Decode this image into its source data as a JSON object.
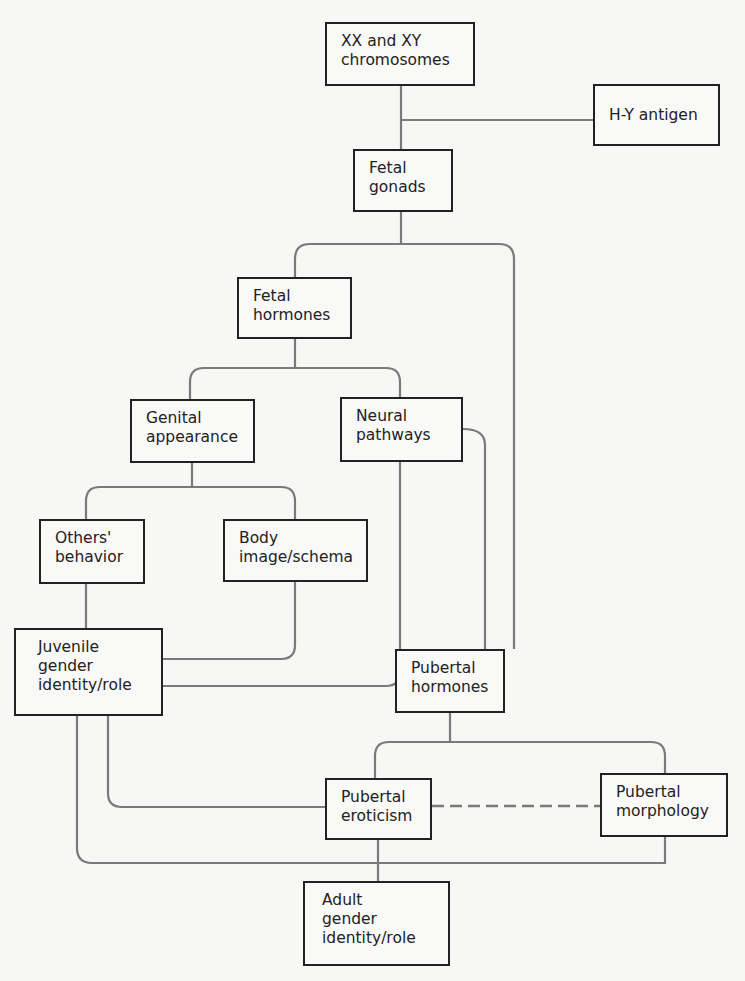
{
  "diagram": {
    "nodes": {
      "chromosomes": "XX and XY\nchromosomes",
      "hy_antigen": "H-Y antigen",
      "fetal_gonads": "Fetal\ngonads",
      "fetal_hormones": "Fetal\nhormones",
      "genital_appearance": "Genital\nappearance",
      "neural_pathways": "Neural\npathways",
      "others_behavior": "Others'\nbehavior",
      "body_image": "Body\nimage/schema",
      "juvenile_identity": "Juvenile\ngender\nidentity/role",
      "pubertal_hormones": "Pubertal\nhormones",
      "pubertal_eroticism": "Pubertal\neroticism",
      "pubertal_morphology": "Pubertal\nmorphology",
      "adult_identity": "Adult\ngender\nidentity/role"
    },
    "edges": [
      [
        "chromosomes",
        "fetal_gonads"
      ],
      [
        "hy_antigen",
        "fetal_gonads"
      ],
      [
        "fetal_gonads",
        "fetal_hormones"
      ],
      [
        "fetal_gonads",
        "pubertal_hormones"
      ],
      [
        "fetal_hormones",
        "genital_appearance"
      ],
      [
        "fetal_hormones",
        "neural_pathways"
      ],
      [
        "genital_appearance",
        "others_behavior"
      ],
      [
        "genital_appearance",
        "body_image"
      ],
      [
        "others_behavior",
        "juvenile_identity"
      ],
      [
        "body_image",
        "juvenile_identity"
      ],
      [
        "neural_pathways",
        "juvenile_identity"
      ],
      [
        "neural_pathways",
        "pubertal_hormones"
      ],
      [
        "pubertal_hormones",
        "pubertal_eroticism"
      ],
      [
        "pubertal_hormones",
        "pubertal_morphology"
      ],
      [
        "juvenile_identity",
        "pubertal_eroticism"
      ],
      [
        "juvenile_identity",
        "adult_identity"
      ],
      [
        "pubertal_morphology",
        "adult_identity"
      ],
      [
        "pubertal_eroticism",
        "adult_identity"
      ],
      [
        "pubertal_eroticism",
        "pubertal_morphology",
        "dashed"
      ]
    ]
  }
}
